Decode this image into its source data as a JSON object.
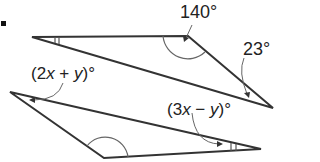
{
  "figure": {
    "problem_marker": ".",
    "upper_triangle": {
      "vertices": {
        "left": [
          32,
          37
        ],
        "top_right": [
          188,
          36
        ],
        "right": [
          273,
          108
        ]
      },
      "angle_labels": {
        "top_right": "140°",
        "right": "23°"
      },
      "congruence_marks": {
        "left": "double-arc-tick"
      }
    },
    "lower_triangle": {
      "vertices": {
        "left": [
          10,
          92
        ],
        "bottom": [
          104,
          158
        ],
        "right": [
          261,
          149
        ]
      },
      "angle_labels": {
        "left": "(2x + y)°",
        "right": "(3x − y)°"
      },
      "angle_label_parts": {
        "left": {
          "open": "(2",
          "var1": "x",
          "op": " + ",
          "var2": "y",
          "close": ")°"
        },
        "right": {
          "open": "(3",
          "var1": "x",
          "op": " − ",
          "var2": "y",
          "close": ")°"
        }
      },
      "congruence_marks": {
        "right": "double-arc-tick",
        "bottom": "angle-arc"
      }
    },
    "colors": {
      "stroke": "#333333",
      "arc": "#666666",
      "text": "#222222"
    }
  }
}
